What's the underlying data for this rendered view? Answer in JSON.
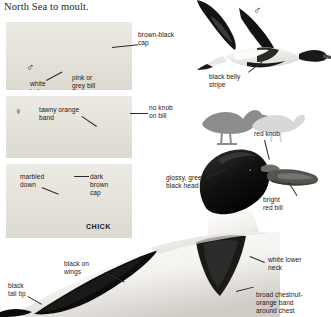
{
  "page": {
    "running_text": "North Sea to moult."
  },
  "symbols": {
    "male": "♂",
    "female": "♀"
  },
  "panels": [
    {
      "id": "panel-male-standing",
      "sex_symbol": "♂",
      "labels": [
        {
          "name": "white-below",
          "text": "white\nbelow"
        },
        {
          "name": "pink-grey-bill",
          "text": "pink or\ngrey bill"
        }
      ]
    },
    {
      "id": "panel-female-swimming",
      "sex_symbol": "♀",
      "labels": [
        {
          "name": "tawny-orange-band",
          "text": "tawny orange\nband"
        }
      ]
    },
    {
      "id": "panel-chick",
      "sex_symbol": "",
      "labels": [
        {
          "name": "marbled-down",
          "text": "marbled\ndown"
        },
        {
          "name": "dark-brown-cap",
          "text": "dark\nbrown\ncap"
        },
        {
          "name": "chick-caption",
          "text": "CHICK"
        }
      ]
    }
  ],
  "callouts": {
    "brown_black_cap": "brown-black\ncap",
    "black_belly_stripe": "black belly\nstripe",
    "no_knob_on_bill": "no knob\non bill",
    "red_knob": "red knob",
    "glossy_green_black_head": "glossy, green-\nblack head",
    "bright_red_bill": "bright\nred bill",
    "white_lower_neck": "white lower\nneck",
    "broad_chestnut_band": "broad chestnut-\norange band\naround chest",
    "black_on_wings": "black on\nwings",
    "black_tail_tip": "black\ntail tip"
  },
  "colors": {
    "text": "#1b1b1b",
    "text_inverse": "#ffffff",
    "panel_bg": "#e8e6e0",
    "page_bg": "#ffffff",
    "leader": "#2a2a2a",
    "silhouette_dark": "#8a8a8a",
    "silhouette_light": "#d5d5d5"
  }
}
